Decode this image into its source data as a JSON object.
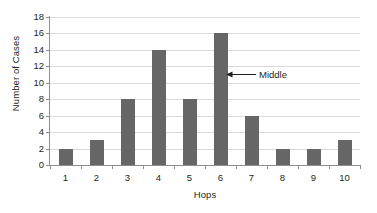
{
  "chart_data": {
    "type": "bar",
    "title": "",
    "subtitle": "",
    "xlabel": "Hops",
    "ylabel": "Number of Cases",
    "categories": [
      "1",
      "2",
      "3",
      "4",
      "5",
      "6",
      "7",
      "8",
      "9",
      "10"
    ],
    "values": [
      2,
      3,
      8,
      14,
      8,
      16,
      6,
      2,
      2,
      3
    ],
    "series": [
      {
        "name": "Number of Cases",
        "values": [
          2,
          3,
          8,
          14,
          8,
          16,
          6,
          2,
          2,
          3
        ]
      }
    ],
    "ylim": [
      0,
      18
    ],
    "ytick_step": 2,
    "yticks": [
      0,
      2,
      4,
      6,
      8,
      10,
      12,
      14,
      16,
      18
    ],
    "ytick_labels": [
      "0",
      "2",
      "4",
      "6",
      "8",
      "10",
      "12",
      "14",
      "16",
      "18"
    ],
    "grid": "horizontal",
    "legend": "none",
    "bar_color": "#666666",
    "gridline_color": "#d9d9d9",
    "axis_color": "#8d8d8d",
    "background_color": "#ffffff",
    "annotations": [
      {
        "label": "Middle",
        "target_category": "6",
        "target_value": 16,
        "arrow_direction": "left",
        "arrow_color": "#231f20"
      }
    ]
  }
}
